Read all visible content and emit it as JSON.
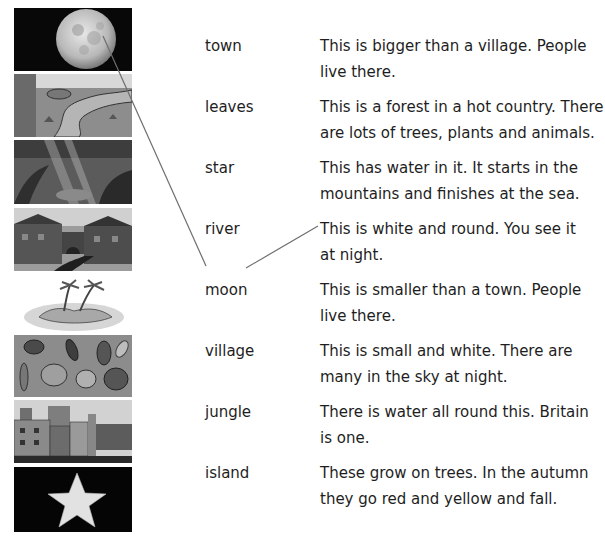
{
  "exercise": {
    "pictures": [
      {
        "subject": "moon",
        "icon": "moon-picture"
      },
      {
        "subject": "river",
        "icon": "river-picture"
      },
      {
        "subject": "jungle",
        "icon": "jungle-picture"
      },
      {
        "subject": "village",
        "icon": "village-picture"
      },
      {
        "subject": "island",
        "icon": "island-picture"
      },
      {
        "subject": "leaves",
        "icon": "leaves-picture"
      },
      {
        "subject": "town",
        "icon": "town-picture"
      },
      {
        "subject": "star",
        "icon": "star-picture"
      }
    ],
    "words": [
      "town",
      "leaves",
      "star",
      "river",
      "moon",
      "village",
      "jungle",
      "island"
    ],
    "definitions": [
      [
        "This is bigger than a village. People",
        "live there."
      ],
      [
        "This is a forest in a hot country. There",
        "are lots of trees, plants and animals."
      ],
      [
        "This has water in it. It starts in the",
        "mountains and finishes at the sea."
      ],
      [
        "This is white and round. You see it",
        "at night."
      ],
      [
        "This is smaller than a town. People",
        "live there."
      ],
      [
        "This is small and white. There are",
        "many in the sky at night."
      ],
      [
        "There is water all round this. Britain",
        "is one."
      ],
      [
        "These grow on trees. In the autumn",
        "they go red and yellow and fall."
      ]
    ],
    "example_lines": [
      {
        "from": "moon picture",
        "to": "moon"
      },
      {
        "from": "moon",
        "to": "This is white and round. You see it at night."
      }
    ],
    "colors": {
      "line": "#6e6e6e",
      "text": "#1e1e1e"
    }
  }
}
